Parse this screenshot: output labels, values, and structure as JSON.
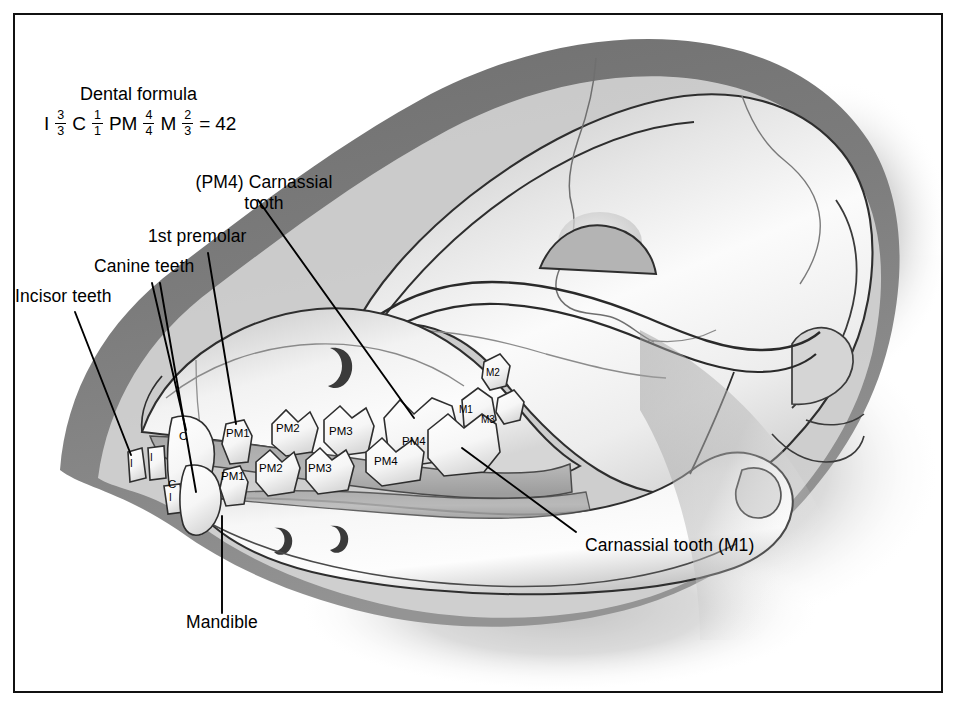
{
  "figure": {
    "background_color": "#ffffff",
    "frame_color": "#111111",
    "ink_color": "#000000"
  },
  "dental_formula": {
    "title": "Dental formula",
    "groups": [
      {
        "symbol": "I",
        "upper": "3",
        "lower": "3"
      },
      {
        "symbol": "C",
        "upper": "1",
        "lower": "1"
      },
      {
        "symbol": "PM",
        "upper": "4",
        "lower": "4"
      },
      {
        "symbol": "M",
        "upper": "2",
        "lower": "3"
      }
    ],
    "equals": "=",
    "total": "42"
  },
  "callouts": [
    {
      "id": "incisor-teeth",
      "text": "Incisor teeth"
    },
    {
      "id": "canine-teeth",
      "text": "Canine teeth"
    },
    {
      "id": "first-premolar",
      "text": "1st premolar"
    },
    {
      "id": "pm4-carnassial",
      "line1": "(PM4) Carnassial",
      "line2": "tooth"
    },
    {
      "id": "carnassial-m1",
      "text": "Carnassial tooth (M1)"
    },
    {
      "id": "mandible",
      "text": "Mandible"
    }
  ],
  "teeth": {
    "upper": [
      {
        "label": "I"
      },
      {
        "label": "I"
      },
      {
        "label": "C"
      },
      {
        "label": "PM1"
      },
      {
        "label": "PM2"
      },
      {
        "label": "PM3"
      },
      {
        "label": "PM4"
      },
      {
        "label": "M1"
      },
      {
        "label": "M2"
      }
    ],
    "lower": [
      {
        "label": "I"
      },
      {
        "label": "C"
      },
      {
        "label": "PM1"
      },
      {
        "label": "PM2"
      },
      {
        "label": "PM3"
      },
      {
        "label": "PM4"
      },
      {
        "label": "M3"
      }
    ]
  },
  "tooth_labels": {
    "i_upper_a": "I",
    "i_upper_b": "I",
    "c_upper": "C",
    "pm1_upper": "PM1",
    "pm2_upper": "PM2",
    "pm3_upper": "PM3",
    "pm4_upper": "PM4",
    "i_lower": "I",
    "c_lower": "C",
    "pm1_lower": "PM1",
    "pm2_lower": "PM2",
    "pm3_lower": "PM3",
    "pm4_lower": "PM4",
    "m1": "M1",
    "m2": "M2",
    "m3": "M3"
  }
}
